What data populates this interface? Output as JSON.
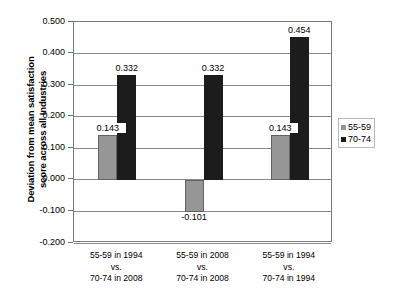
{
  "chart_data": {
    "type": "bar",
    "title": "",
    "xlabel": "",
    "ylabel": "Deviation from mean satisfaction\nscore across all Industries",
    "ylim": [
      -0.2,
      0.5
    ],
    "ytick_labels": [
      "0.500",
      "0.400",
      "0.300",
      "0.200",
      "0.100",
      "0.000",
      "-0.100",
      "-0.200"
    ],
    "ytick_values": [
      0.5,
      0.4,
      0.3,
      0.2,
      0.1,
      0.0,
      -0.1,
      -0.2
    ],
    "grid": true,
    "legend_position": "right",
    "categories": [
      "55-59 in 1994\nvs.\n70-74 in 2008",
      "55-59 in 2008\nvs.\n70-74 in 2008",
      "55-59 in 1994\nvs.\n70-74 in 1994"
    ],
    "series": [
      {
        "name": "55-59",
        "color": "#969696",
        "values": [
          0.143,
          -0.101,
          0.143
        ],
        "labels": [
          "0.143",
          "-0.101",
          "0.143"
        ]
      },
      {
        "name": "70-74",
        "color": "#1c1c1c",
        "values": [
          0.332,
          0.332,
          0.454
        ],
        "labels": [
          "0.332",
          "0.332",
          "0.454"
        ]
      }
    ]
  },
  "legend": {
    "items": [
      {
        "label": "55-59"
      },
      {
        "label": "70-74"
      }
    ]
  }
}
